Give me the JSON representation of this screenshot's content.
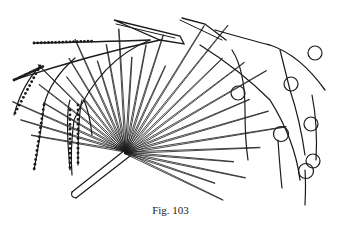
{
  "figure": {
    "caption": "Fig. 103",
    "ink_color": "#1a1a1a",
    "paper_color": "#ffffff"
  }
}
